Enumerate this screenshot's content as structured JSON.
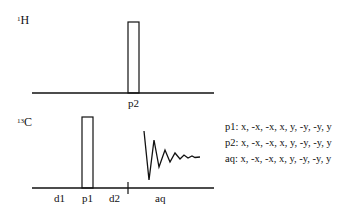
{
  "diagram": {
    "type": "NMR pulse sequence",
    "channels": [
      {
        "id": "1H",
        "mass": "1",
        "element": "H",
        "pulses": [
          {
            "label": "p2"
          }
        ]
      },
      {
        "id": "13C",
        "mass": "13",
        "element": "C",
        "pulses": [
          {
            "label": "p1"
          }
        ],
        "delays": [
          "d1",
          "d2"
        ],
        "acquisition": "aq"
      }
    ],
    "timeline_labels": {
      "d1": "d1",
      "p1": "p1",
      "d2": "d2",
      "aq": "aq",
      "p2": "p2"
    },
    "phase_cycles": [
      {
        "text": "p1: x, -x, -x, x, y, -y, -y, y"
      },
      {
        "text": "p2: x, -x, -x, x, y, -y, -y, y"
      },
      {
        "text": "aq: x, -x, -x, x, y, -y, -y, y"
      }
    ],
    "line_color": "#111111"
  }
}
